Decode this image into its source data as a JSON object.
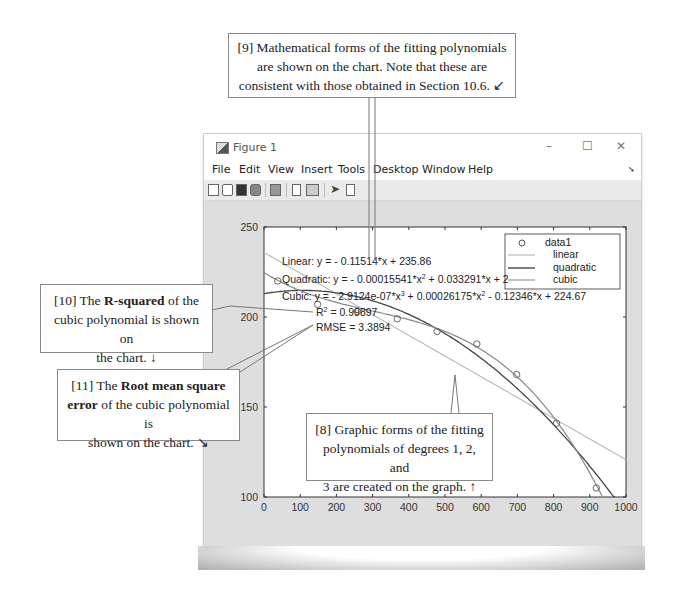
{
  "callouts": {
    "c9": {
      "number": "[9]",
      "text1": "Mathematical forms of the fitting polynomials",
      "text2": "are shown on the chart.  Note that these are",
      "text3": "consistent with those obtained in Section 10.6.",
      "arrow": "↙"
    },
    "c10": {
      "number": "[10] The ",
      "bold": "R-squared",
      "text1": " of the",
      "text2": "cubic polynomial is shown on",
      "text3": "the chart.",
      "arrow": "↓"
    },
    "c11": {
      "number": "[11] The ",
      "bold1": "Root mean square",
      "bold2": "error",
      "text1": " of the cubic polynomial is",
      "text2": "shown on the chart.",
      "arrow": "↘"
    },
    "c8": {
      "text1": "[8] Graphic forms of the fitting",
      "text2": "polynomials of degrees 1, 2, and",
      "text3": "3 are created on the graph.",
      "arrow": "↑"
    }
  },
  "window": {
    "title": "Figure 1",
    "minimize": "–",
    "maximize": "☐",
    "close": "✕",
    "dock_icon": "dock-arrow",
    "menu": [
      "File",
      "Edit",
      "View",
      "Insert",
      "Tools",
      "Desktop",
      "Window",
      "Help"
    ],
    "toolbar_icons": [
      "new-figure-icon",
      "open-file-icon",
      "save-icon",
      "print-icon",
      "print-preview-icon",
      "hide-plot-tools-icon",
      "show-plot-tools-icon",
      "pointer-icon",
      "insert-legend-icon"
    ]
  },
  "annotations": {
    "linear": "Linear:  y = - 0.11514*x + 235.86",
    "quadratic_a": "Quadratic:  y = - 0.00015541*x",
    "quadratic_b": " + 0.033291*x + 2",
    "cubic_a": "Cubic:  y = - 2.9124e-07*x",
    "cubic_b": " + 0.00026175*x",
    "cubic_c": " - 0.12346*x + 224.67",
    "r2_a": "R",
    "r2_b": " = 0.99897",
    "rmse": "RMSE = 3.3894",
    "sup2": "2",
    "sup3": "3"
  },
  "chart_data": {
    "type": "scatter",
    "title": "",
    "xlabel": "",
    "ylabel": "",
    "xlim": [
      0,
      1000
    ],
    "ylim": [
      100,
      250
    ],
    "xticks": [
      0,
      100,
      200,
      300,
      400,
      500,
      600,
      700,
      800,
      900,
      1000
    ],
    "yticks": [
      100,
      150,
      200,
      250
    ],
    "grid": false,
    "legend_position": "northeast",
    "legend": [
      "data1",
      "linear",
      "quadratic",
      "cubic"
    ],
    "series": [
      {
        "name": "data1",
        "kind": "markers",
        "x": [
          38,
          148,
          258,
          368,
          478,
          588,
          698,
          808,
          918
        ],
        "y": [
          220,
          207,
          203,
          199,
          192,
          185,
          168,
          141,
          105
        ]
      },
      {
        "name": "linear",
        "kind": "line",
        "equation": "y = -0.11514*x + 235.86",
        "coeffs": [
          -0.11514,
          235.86
        ]
      },
      {
        "name": "quadratic",
        "kind": "line",
        "equation": "y = -0.00015541*x^2 + 0.033291*x + 2..",
        "coeffs": [
          -0.00015541,
          0.033291,
          213
        ]
      },
      {
        "name": "cubic",
        "kind": "line",
        "equation": "y = -2.9124e-07*x^3 + 0.00026175*x^2 - 0.12346*x + 224.67",
        "coeffs": [
          -2.9124e-07,
          0.00026175,
          -0.12346,
          224.67
        ]
      }
    ],
    "stats": {
      "R2": 0.99897,
      "RMSE": 3.3894
    }
  }
}
